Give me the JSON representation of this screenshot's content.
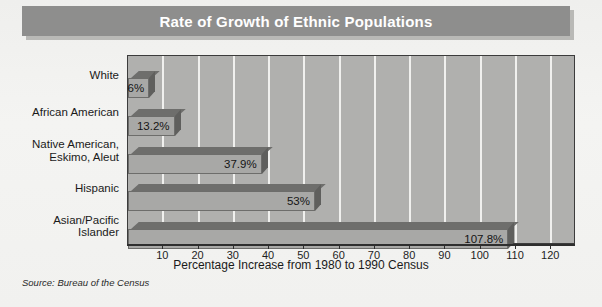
{
  "title": "Rate of Growth of Ethnic Populations",
  "source_note": "Source: Bureau of the Census",
  "chart_data": {
    "type": "bar",
    "orientation": "horizontal",
    "title": "Rate of Growth of Ethnic Populations",
    "xlabel": "Percentage Increase from 1980 to 1990 Census",
    "ylabel": "",
    "categories": [
      "White",
      "African American",
      "Native American,\nEskimo, Aleut",
      "Hispanic",
      "Asian/Pacific\nIslander"
    ],
    "values": [
      6,
      13.2,
      37.9,
      53,
      107.8
    ],
    "value_labels": [
      "6%",
      "13.2%",
      "37.9%",
      "53%",
      "107.8%"
    ],
    "xlim": [
      0,
      127
    ],
    "xticks": [
      10,
      20,
      30,
      40,
      50,
      60,
      70,
      80,
      90,
      100,
      110,
      120
    ],
    "xtick_labels": [
      "10",
      "20",
      "30",
      "40",
      "50",
      "60",
      "70",
      "80",
      "90",
      "100",
      "110",
      "120"
    ],
    "grid": "vertical",
    "legend": "none",
    "colors": {
      "plot_background": "#b0b0ae",
      "gridline": "#f0f0ee",
      "bar_front": "#a8a8a6",
      "bar_top": "#6e6e6c",
      "bar_side": "#5f5f5d",
      "title_band": "#8e8e8d",
      "title_text": "#ffffff",
      "page_background": "#f2f2f0"
    }
  }
}
